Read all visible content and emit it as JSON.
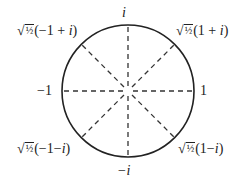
{
  "diagram": {
    "title": "",
    "shape": "unit-circle",
    "center": {
      "x": 128,
      "y": 91
    },
    "radius": 66,
    "stroke_color": "#222222",
    "dash_color": "#333333",
    "axis_labels": {
      "top": "i",
      "bottom": "−i",
      "left": "−1",
      "right": "1"
    },
    "diagonal_labels": {
      "top_right": {
        "coef": "√",
        "frac": "½",
        "expr": "(1 + ",
        "var": "i",
        "close": ")"
      },
      "top_left": {
        "coef": "√",
        "frac": "½",
        "expr": "(−1 + ",
        "var": "i",
        "close": ")"
      },
      "bottom_left": {
        "coef": "√",
        "frac": "½",
        "expr": "(−1−",
        "var": "i",
        "close": ")"
      },
      "bottom_right": {
        "coef": "√",
        "frac": "½",
        "expr": "(1−",
        "var": "i",
        "close": ")"
      }
    },
    "points": [
      {
        "name": "1",
        "angle_deg": 0
      },
      {
        "name": "sqrt(1/2)(1+i)",
        "angle_deg": 45
      },
      {
        "name": "i",
        "angle_deg": 90
      },
      {
        "name": "sqrt(1/2)(-1+i)",
        "angle_deg": 135
      },
      {
        "name": "-1",
        "angle_deg": 180
      },
      {
        "name": "sqrt(1/2)(-1-i)",
        "angle_deg": 225
      },
      {
        "name": "-i",
        "angle_deg": 270
      },
      {
        "name": "sqrt(1/2)(1-i)",
        "angle_deg": 315
      }
    ]
  }
}
